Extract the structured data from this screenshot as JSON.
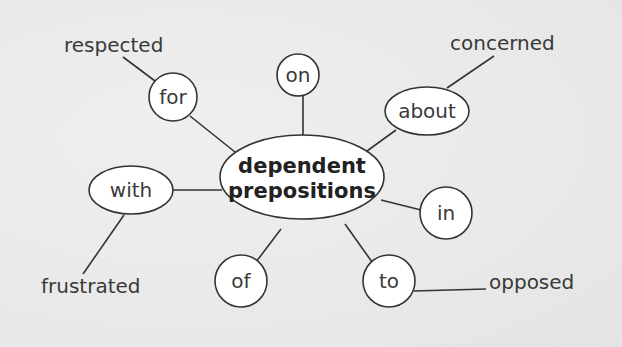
{
  "diagram": {
    "type": "mind-map",
    "center": {
      "line1": "dependent",
      "line2": "prepositions"
    },
    "prepositions": [
      {
        "id": "on",
        "label": "on"
      },
      {
        "id": "for",
        "label": "for"
      },
      {
        "id": "about",
        "label": "about"
      },
      {
        "id": "with",
        "label": "with"
      },
      {
        "id": "in",
        "label": "in"
      },
      {
        "id": "of",
        "label": "of"
      },
      {
        "id": "to",
        "label": "to"
      }
    ],
    "adjectives": [
      {
        "label": "respected",
        "preposition": "for"
      },
      {
        "label": "concerned",
        "preposition": "about"
      },
      {
        "label": "frustrated",
        "preposition": "with"
      },
      {
        "label": "opposed",
        "preposition": "to"
      }
    ]
  }
}
